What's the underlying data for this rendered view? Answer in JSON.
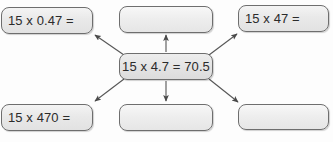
{
  "diagram": {
    "center": {
      "id": "center-node",
      "text": "15 x 4.7 = 70.5",
      "empty": false
    },
    "nodes": [
      {
        "id": "top-left",
        "text": "15 x 0.47 =",
        "empty": false
      },
      {
        "id": "top-middle",
        "text": "",
        "empty": true
      },
      {
        "id": "top-right",
        "text": "15 x 47 =",
        "empty": false
      },
      {
        "id": "bottom-left",
        "text": "15 x 470 =",
        "empty": false
      },
      {
        "id": "bottom-middle",
        "text": "",
        "empty": true
      },
      {
        "id": "bottom-right",
        "text": "",
        "empty": true
      }
    ],
    "arrows": [
      {
        "id": "arrow-to-top-left",
        "from": "center",
        "to": "top-left",
        "direction": "up-left"
      },
      {
        "id": "arrow-to-top-middle",
        "from": "center",
        "to": "top-middle",
        "direction": "up"
      },
      {
        "id": "arrow-to-top-right",
        "from": "center",
        "to": "top-right",
        "direction": "up-right"
      },
      {
        "id": "arrow-to-bottom-left",
        "from": "center",
        "to": "bottom-left",
        "direction": "down-left"
      },
      {
        "id": "arrow-to-bottom-middle",
        "from": "center",
        "to": "bottom-middle",
        "direction": "down"
      },
      {
        "id": "arrow-to-bottom-right",
        "from": "center",
        "to": "bottom-right",
        "direction": "down-right"
      }
    ]
  },
  "colors": {
    "background": "#fdfdfd",
    "box_border": "#6e6e6e",
    "box_fill": "#e9e9e9",
    "text": "#2b2b2b",
    "arrow": "#555555"
  }
}
